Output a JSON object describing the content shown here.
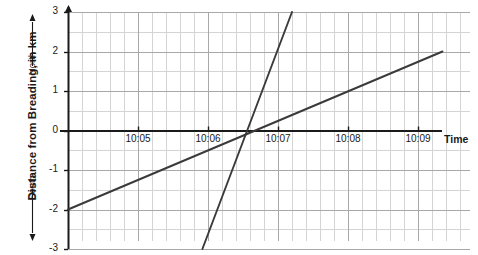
{
  "chart_data": {
    "type": "line",
    "title": "",
    "xlabel": "Time",
    "ylabel": "Distance from Breading, in km",
    "ylabel_direction_positive": "North",
    "ylabel_direction_negative": "South",
    "grid": true,
    "legend": "none",
    "xlim": [
      "10:04",
      "10:09:40"
    ],
    "ylim": [
      -3,
      3
    ],
    "x_tick_labels": [
      "10:05",
      "10:06",
      "10:07",
      "10:08",
      "10:09"
    ],
    "x_tick_values": [
      5,
      6,
      7,
      8,
      9
    ],
    "x_minor_divisions_per_major": 5,
    "y_tick_labels": [
      "3",
      "2",
      "1",
      "0",
      "-1",
      "-2",
      "-3"
    ],
    "y_tick_values": [
      3,
      2,
      1,
      0,
      -1,
      -2,
      -3
    ],
    "y_minor_divisions_per_major": 2,
    "series": [
      {
        "name": "shallow-line",
        "color": "#3a3a3a",
        "points": [
          {
            "x": 4.0,
            "y": -2
          },
          {
            "x": 9.35,
            "y": 2
          }
        ],
        "x_axis_crossing": "10:06:40"
      },
      {
        "name": "steep-line",
        "color": "#3a3a3a",
        "points": [
          {
            "x": 5.92,
            "y": -3
          },
          {
            "x": 7.2,
            "y": 3
          }
        ],
        "x_axis_crossing": "10:06:33"
      }
    ],
    "colors": {
      "axis": "#1a1a1a",
      "major_grid": "#a8a8a8",
      "minor_grid": "#d4d4d4",
      "line": "#3a3a3a",
      "text": "#1a1a1a",
      "background": "#ffffff"
    }
  }
}
